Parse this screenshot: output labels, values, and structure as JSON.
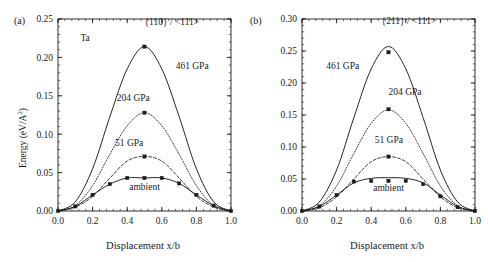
{
  "figure": {
    "background_color": "#ffffff",
    "ink_color": "#1a1a1a",
    "width": 488,
    "height": 262
  },
  "panels": [
    {
      "tag": "(a)",
      "material_label": "Ta",
      "slip_system_label": "{110} / <111>",
      "xlabel": "Displacement x/b",
      "ylabel_prefix": "Energy (eV/A",
      "ylabel_sup": "2",
      "ylabel_suffix": ")",
      "ylabel_full": "Energy (eV/A2)",
      "xticks": [
        "0.0",
        "0.2",
        "0.4",
        "0.6",
        "0.8",
        "1.0"
      ],
      "yticks": [
        "0.00",
        "0.05",
        "0.10",
        "0.15",
        "0.20",
        "0.25"
      ],
      "curve_labels": [
        "461 GPa",
        "204 GPa",
        "51 GPa",
        "ambient"
      ]
    },
    {
      "tag": "(b)",
      "material_label": "",
      "slip_system_label": "{211} / <111>",
      "xlabel": "Displacement x/b",
      "ylabel_prefix": "",
      "ylabel_sup": "",
      "ylabel_suffix": "",
      "ylabel_full": "",
      "xticks": [
        "0.0",
        "0.2",
        "0.4",
        "0.6",
        "0.8",
        "1.0"
      ],
      "yticks": [
        "0.00",
        "0.05",
        "0.10",
        "0.15",
        "0.20",
        "0.25",
        "0.30"
      ],
      "curve_labels": [
        "461 GPa",
        "204 GPa",
        "51 GPa",
        "ambient"
      ]
    }
  ],
  "chart_data": [
    {
      "type": "line",
      "panel": "(a)",
      "title": "{110} / <111>",
      "annotations": [
        "Ta",
        "{110} / <111>",
        "461 GPa",
        "204 GPa",
        "51 GPa",
        "ambient"
      ],
      "xlabel": "Displacement x/b",
      "ylabel": "Energy (eV/A2)",
      "xlim": [
        0.0,
        1.0
      ],
      "ylim": [
        0.0,
        0.25
      ],
      "xticks": [
        0.0,
        0.2,
        0.4,
        0.6,
        0.8,
        1.0
      ],
      "yticks": [
        0.0,
        0.05,
        0.1,
        0.15,
        0.2,
        0.25
      ],
      "grid": false,
      "legend": "inline-annotations",
      "x": [
        0.0,
        0.1,
        0.2,
        0.3,
        0.4,
        0.5,
        0.6,
        0.7,
        0.8,
        0.9,
        1.0
      ],
      "series": [
        {
          "name": "461 GPa",
          "style": "solid",
          "markers": [
            {
              "x": 0.5,
              "y": 0.214
            }
          ],
          "values": [
            0.0,
            0.012,
            0.055,
            0.123,
            0.185,
            0.214,
            0.185,
            0.123,
            0.055,
            0.012,
            0.0
          ]
        },
        {
          "name": "204 GPa",
          "style": "dotted",
          "markers": [
            {
              "x": 0.5,
              "y": 0.128
            }
          ],
          "values": [
            0.0,
            0.007,
            0.033,
            0.074,
            0.111,
            0.128,
            0.111,
            0.074,
            0.033,
            0.007,
            0.0
          ]
        },
        {
          "name": "51 GPa",
          "style": "dashed",
          "markers": [
            {
              "x": 0.5,
              "y": 0.071
            }
          ],
          "values": [
            0.0,
            0.005,
            0.019,
            0.043,
            0.065,
            0.071,
            0.065,
            0.043,
            0.019,
            0.005,
            0.0
          ]
        },
        {
          "name": "ambient",
          "style": "solid",
          "markers": [
            {
              "x": 0.0,
              "y": 0.0
            },
            {
              "x": 0.1,
              "y": 0.006
            },
            {
              "x": 0.2,
              "y": 0.021
            },
            {
              "x": 0.3,
              "y": 0.035
            },
            {
              "x": 0.4,
              "y": 0.043
            },
            {
              "x": 0.5,
              "y": 0.043
            },
            {
              "x": 0.6,
              "y": 0.043
            },
            {
              "x": 0.7,
              "y": 0.036
            },
            {
              "x": 0.8,
              "y": 0.021
            },
            {
              "x": 0.9,
              "y": 0.007
            },
            {
              "x": 1.0,
              "y": 0.0
            }
          ],
          "values": [
            0.0,
            0.006,
            0.021,
            0.035,
            0.043,
            0.043,
            0.043,
            0.036,
            0.021,
            0.007,
            0.0
          ]
        }
      ]
    },
    {
      "type": "line",
      "panel": "(b)",
      "title": "{211} / <111>",
      "annotations": [
        "{211} / <111>",
        "461 GPa",
        "204 GPa",
        "51 GPa",
        "ambient"
      ],
      "xlabel": "Displacement x/b",
      "ylabel": "",
      "xlim": [
        0.0,
        1.0
      ],
      "ylim": [
        0.0,
        0.3
      ],
      "xticks": [
        0.0,
        0.2,
        0.4,
        0.6,
        0.8,
        1.0
      ],
      "yticks": [
        0.0,
        0.05,
        0.1,
        0.15,
        0.2,
        0.25,
        0.3
      ],
      "grid": false,
      "legend": "inline-annotations",
      "x": [
        0.0,
        0.1,
        0.2,
        0.3,
        0.4,
        0.5,
        0.6,
        0.7,
        0.8,
        0.9,
        1.0
      ],
      "series": [
        {
          "name": "461 GPa",
          "style": "solid",
          "markers": [
            {
              "x": 0.5,
              "y": 0.248
            }
          ],
          "values": [
            0.0,
            0.014,
            0.064,
            0.146,
            0.222,
            0.257,
            0.222,
            0.146,
            0.064,
            0.014,
            0.0
          ]
        },
        {
          "name": "204 GPa",
          "style": "dotted",
          "markers": [
            {
              "x": 0.5,
              "y": 0.159
            }
          ],
          "values": [
            0.0,
            0.008,
            0.039,
            0.09,
            0.137,
            0.158,
            0.137,
            0.09,
            0.039,
            0.008,
            0.0
          ]
        },
        {
          "name": "51 GPa",
          "style": "dashed",
          "markers": [
            {
              "x": 0.5,
              "y": 0.085
            }
          ],
          "values": [
            0.0,
            0.005,
            0.022,
            0.05,
            0.077,
            0.085,
            0.077,
            0.05,
            0.022,
            0.005,
            0.0
          ]
        },
        {
          "name": "ambient",
          "style": "solid",
          "markers": [
            {
              "x": 0.0,
              "y": 0.0
            },
            {
              "x": 0.1,
              "y": 0.007
            },
            {
              "x": 0.2,
              "y": 0.025
            },
            {
              "x": 0.3,
              "y": 0.046
            },
            {
              "x": 0.4,
              "y": 0.047
            },
            {
              "x": 0.5,
              "y": 0.047
            },
            {
              "x": 0.6,
              "y": 0.047
            },
            {
              "x": 0.7,
              "y": 0.042
            },
            {
              "x": 0.8,
              "y": 0.023
            },
            {
              "x": 0.9,
              "y": 0.006
            },
            {
              "x": 1.0,
              "y": 0.0
            }
          ],
          "values": [
            0.0,
            0.007,
            0.025,
            0.044,
            0.051,
            0.052,
            0.051,
            0.044,
            0.025,
            0.007,
            0.0
          ]
        }
      ]
    }
  ]
}
